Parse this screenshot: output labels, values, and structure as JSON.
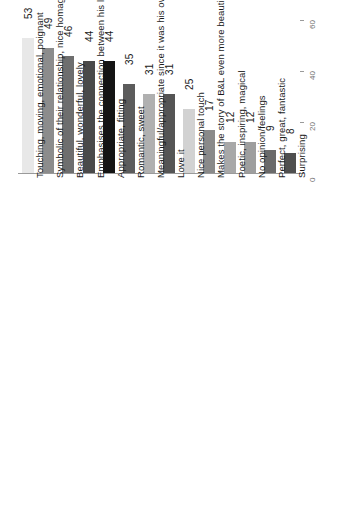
{
  "chart_data": {
    "type": "bar",
    "title": "",
    "xlabel": "",
    "ylabel": "",
    "orientation": "vertical-rotated",
    "grid": false,
    "legend": "none",
    "ylim": [
      0,
      60
    ],
    "yticks": [
      "0",
      "20",
      "40",
      "60"
    ],
    "categories": [
      "Touching, moving, emotional, poignant",
      "Symbolic of their relationship, nice homage/parallel to their love story",
      "Beautiful, wonderful, lovely",
      "Emphasises the connection between his life and work",
      "Appropriate, fitting",
      "Romantic, sweet",
      "Meaningful/appropriate since it was his own choice",
      "Love it",
      "Nice personal touch",
      "Makes the story of B&L even more beautiful/powerful/significant/real",
      "Poetic, inspiring, magical",
      "No opinion/feelings",
      "Perfect, great, fantastic",
      "Surprising"
    ],
    "values": [
      53,
      49,
      46,
      44,
      44,
      35,
      31,
      31,
      25,
      17,
      12,
      12,
      9,
      8
    ],
    "bar_colors": [
      "#e8e8e8",
      "#8c8c8c",
      "#6e6e6e",
      "#4a4a4a",
      "#141414",
      "#5c5c5c",
      "#b0b0b0",
      "#555555",
      "#d2d2d2",
      "#8a8a8a",
      "#a8a8a8",
      "#9e9e9e",
      "#6a6a6a",
      "#4f4f4f"
    ]
  },
  "axis": {
    "tick_color": "#6f6f6f",
    "line_color": "#9a9a9a"
  },
  "labels": {
    "value_color": "#1a1a1a",
    "category_color": "#1a1a1a"
  }
}
